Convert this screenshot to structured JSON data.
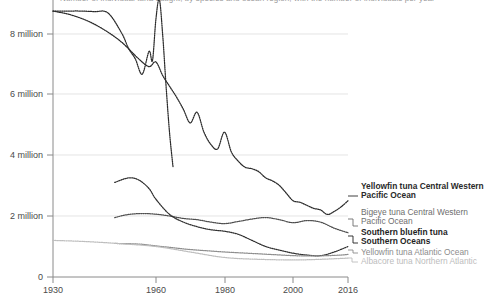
{
  "chart_data": {
    "type": "line",
    "title": "Number of individual tuna caught, by species and ocean region, with the number of individuals per year",
    "title_clipped": true,
    "xlabel": "",
    "ylabel": "",
    "xlim": [
      1930,
      2016
    ],
    "ylim": [
      0,
      9000000
    ],
    "grid": "horizontal",
    "legend_position": "right",
    "x_ticks": [
      "1930",
      "1960",
      "1980",
      "2000",
      "2016"
    ],
    "x_tick_values": [
      1930,
      1960,
      1980,
      2000,
      2016
    ],
    "y_ticks": [
      "0",
      "2 million",
      "4 million",
      "6 million",
      "8 million"
    ],
    "y_tick_values": [
      0,
      2000000,
      4000000,
      6000000,
      8000000
    ],
    "series": [
      {
        "name": "Skipjack tuna Western Central Pacific Ocean",
        "label_in_legend": false,
        "style": "dotted",
        "color": "#2a2a2a",
        "x": [
          1930,
          1934,
          1938,
          1942,
          1946,
          1950,
          1952,
          1954,
          1956,
          1958,
          1959,
          1960,
          1961,
          1962,
          1963,
          1964,
          1965
        ],
        "y": [
          8720000,
          8720000,
          8720000,
          8700000,
          8660000,
          8000000,
          7500000,
          7150000,
          6650000,
          7400000,
          7100000,
          8450000,
          9100000,
          7900000,
          6200000,
          4700000,
          3600000
        ]
      },
      {
        "name": "Yellowfin tuna Central Western Pacific Ocean",
        "label_in_legend": true,
        "style": "dotted",
        "color": "#2a2a2a",
        "x": [
          1930,
          1935,
          1940,
          1945,
          1950,
          1955,
          1958,
          1960,
          1962,
          1964,
          1966,
          1968,
          1970,
          1972,
          1974,
          1976,
          1978,
          1980,
          1982,
          1984,
          1986,
          1988,
          1990,
          1992,
          1994,
          1996,
          1998,
          2000,
          2002,
          2004,
          2006,
          2008,
          2010,
          2012,
          2014,
          2016
        ],
        "y": [
          8720000,
          8600000,
          8400000,
          8100000,
          7700000,
          7150000,
          6900000,
          7050000,
          6600000,
          6250000,
          5900000,
          5500000,
          5050000,
          5400000,
          4750000,
          4350000,
          4200000,
          4750000,
          4100000,
          3800000,
          3600000,
          3550000,
          3450000,
          3250000,
          3150000,
          3000000,
          2750000,
          2500000,
          2450000,
          2350000,
          2250000,
          2200000,
          2050000,
          2150000,
          2300000,
          2500000
        ]
      },
      {
        "name": "Bigeye tuna Central Western Pacific Ocean",
        "label_in_legend": true,
        "style": "dotted",
        "color": "#4d4d4d",
        "x": [
          1948,
          1952,
          1956,
          1960,
          1964,
          1968,
          1972,
          1976,
          1980,
          1984,
          1988,
          1992,
          1996,
          2000,
          2004,
          2008,
          2012,
          2016
        ],
        "y": [
          1950000,
          2050000,
          2080000,
          2060000,
          2000000,
          1920000,
          1880000,
          1800000,
          1750000,
          1820000,
          1900000,
          1950000,
          1880000,
          1780000,
          1850000,
          1800000,
          1600000,
          1450000
        ]
      },
      {
        "name": "Southern bluefin tuna Southern Oceans",
        "label_in_legend": true,
        "style": "dotted",
        "color": "#2f2f2f",
        "x": [
          1948,
          1952,
          1955,
          1958,
          1960,
          1964,
          1968,
          1972,
          1976,
          1980,
          1984,
          1988,
          1992,
          1996,
          2000,
          2004,
          2008,
          2012,
          2016
        ],
        "y": [
          3100000,
          3250000,
          3180000,
          2900000,
          2550000,
          2050000,
          1800000,
          1650000,
          1550000,
          1500000,
          1400000,
          1200000,
          1000000,
          880000,
          780000,
          720000,
          700000,
          820000,
          1000000
        ]
      },
      {
        "name": "Yellowfin tuna Atlantic Ocean",
        "label_in_legend": true,
        "style": "dotted",
        "color": "#8c8c8c",
        "x": [
          1948,
          1955,
          1960,
          1965,
          1970,
          1975,
          1980,
          1985,
          1990,
          1995,
          2000,
          2005,
          2010,
          2014,
          2016
        ],
        "y": [
          1100000,
          1080000,
          1020000,
          960000,
          900000,
          860000,
          820000,
          790000,
          760000,
          730000,
          700000,
          690000,
          700000,
          720000,
          740000
        ]
      },
      {
        "name": "Albacore tuna Northern Atlantic",
        "label_in_legend": true,
        "style": "dotted",
        "color": "#bdbdbd",
        "x": [
          1930,
          1940,
          1950,
          1960,
          1970,
          1980,
          1990,
          2000,
          2008,
          2016
        ],
        "y": [
          1200000,
          1160000,
          1090000,
          1000000,
          820000,
          640000,
          580000,
          560000,
          580000,
          620000
        ]
      }
    ]
  },
  "axes": {
    "y_labels": [
      "8 million",
      "6 million",
      "4 million",
      "2 million",
      "0"
    ],
    "x_labels": [
      "1930",
      "1960",
      "1980",
      "2000",
      "2016"
    ]
  },
  "legend": [
    {
      "id": "yellowfin-cwp",
      "line1": "Yellowfin tuna Central Western",
      "line2": "Pacific Ocean",
      "color": "#2a2a2a",
      "weight": "600"
    },
    {
      "id": "bigeye-cwp",
      "line1": "Bigeye tuna Central Western",
      "line2": "Pacific Ocean",
      "color": "#6e6e6e",
      "weight": "400"
    },
    {
      "id": "southern-bluefin",
      "line1": "Southern bluefin tuna",
      "line2": "Southern Oceans",
      "color": "#1f1f1f",
      "weight": "600"
    },
    {
      "id": "yellowfin-atlantic",
      "line1": "Yellowfin tuna Atlantic Ocean",
      "line2": "",
      "color": "#8c8c8c",
      "weight": "400"
    },
    {
      "id": "albacore-natlantic",
      "line1": "Albacore tuna Northern Atlantic",
      "line2": "",
      "color": "#bdbdbd",
      "weight": "400"
    }
  ]
}
